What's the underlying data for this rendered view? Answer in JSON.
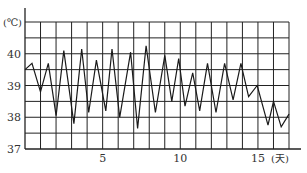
{
  "chart_data": {
    "type": "line",
    "title": "",
    "xlabel": "(天)",
    "ylabel": "(℃)",
    "xlim": [
      0,
      17
    ],
    "ylim": [
      37,
      41
    ],
    "grid": true,
    "x_grid_step": 1,
    "y_grid_step": 0.5,
    "x_tick_labels": [
      {
        "value": 5,
        "label": "5"
      },
      {
        "value": 10,
        "label": "10"
      },
      {
        "value": 15,
        "label": "15"
      }
    ],
    "y_tick_labels": [
      {
        "value": 37,
        "label": "37"
      },
      {
        "value": 38,
        "label": "38"
      },
      {
        "value": 39,
        "label": "39"
      },
      {
        "value": 40,
        "label": "40"
      }
    ],
    "series": [
      {
        "name": "temperature",
        "x": [
          0,
          0.45,
          1,
          1.5,
          2,
          2.5,
          3.15,
          3.65,
          4.1,
          4.6,
          5.2,
          5.6,
          6.1,
          6.8,
          7.25,
          7.8,
          8.4,
          9.0,
          9.45,
          9.9,
          10.3,
          10.8,
          11.25,
          11.75,
          12.3,
          12.85,
          13.4,
          13.9,
          14.4,
          14.95,
          15.65,
          16.0,
          16.5,
          17.0
        ],
        "values": [
          39.5,
          39.7,
          38.8,
          39.7,
          38.05,
          40.1,
          37.8,
          40.15,
          38.15,
          39.8,
          38.2,
          40.15,
          38.0,
          40.05,
          37.65,
          40.25,
          38.15,
          39.95,
          38.5,
          39.85,
          38.35,
          39.4,
          38.2,
          39.7,
          38.15,
          39.7,
          38.55,
          39.7,
          38.65,
          39.0,
          37.75,
          38.5,
          37.7,
          38.1
        ]
      }
    ]
  },
  "colors": {
    "line": "#1a1a1a",
    "grid": "#222222",
    "text": "#333333",
    "background": "#ffffff"
  }
}
